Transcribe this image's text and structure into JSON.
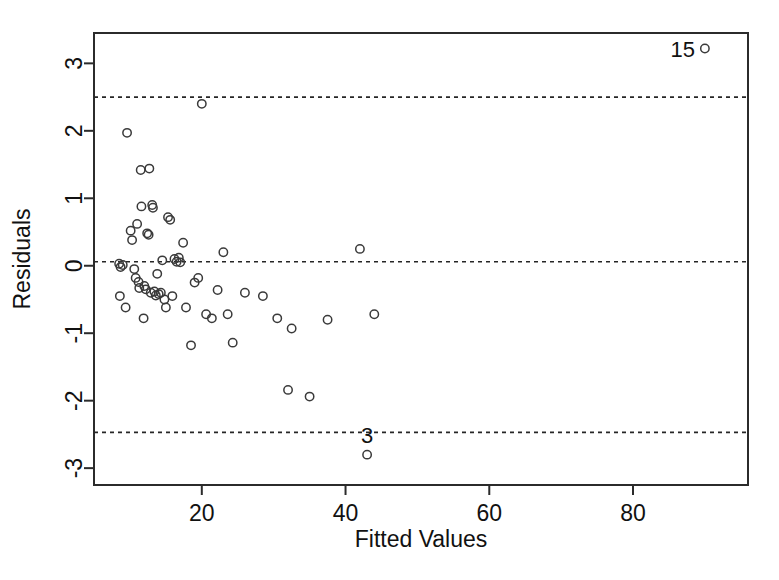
{
  "chart_data": {
    "type": "scatter",
    "title": "",
    "xlabel": "Fitted Values",
    "ylabel": "Residuals",
    "xlim": [
      5,
      96
    ],
    "ylim": [
      -3.25,
      3.45
    ],
    "xticks": [
      20,
      40,
      60,
      80
    ],
    "yticks": [
      3,
      2,
      1,
      0,
      -1,
      -2,
      -3
    ],
    "xtick_labels": [
      "20",
      "40",
      "60",
      "80"
    ],
    "ytick_labels": [
      "3",
      "2",
      "1",
      "0",
      "-1",
      "-2",
      "-3"
    ],
    "grid": false,
    "legend": "none",
    "marker": "open-circle",
    "reference_lines": [
      {
        "name": "upper-bound",
        "y": 2.5,
        "style": "dashed"
      },
      {
        "name": "zero-line",
        "y": 0.06,
        "style": "dashed"
      },
      {
        "name": "lower-bound",
        "y": -2.47,
        "style": "dashed"
      }
    ],
    "annotations": [
      {
        "text": "15",
        "x": 90.0,
        "y": 3.22,
        "position": "left-of-point"
      },
      {
        "text": "3",
        "x": 43.0,
        "y": -2.8,
        "position": "above-point"
      }
    ],
    "points": [
      {
        "x": 8.5,
        "y": 0.03
      },
      {
        "x": 8.7,
        "y": -0.02
      },
      {
        "x": 9.0,
        "y": 0.01
      },
      {
        "x": 8.6,
        "y": -0.45
      },
      {
        "x": 9.4,
        "y": -0.62
      },
      {
        "x": 9.6,
        "y": 1.97
      },
      {
        "x": 10.1,
        "y": 0.52
      },
      {
        "x": 10.3,
        "y": 0.38
      },
      {
        "x": 10.6,
        "y": -0.05
      },
      {
        "x": 10.8,
        "y": -0.18
      },
      {
        "x": 11.0,
        "y": 0.62
      },
      {
        "x": 11.2,
        "y": -0.24
      },
      {
        "x": 11.3,
        "y": -0.33
      },
      {
        "x": 11.5,
        "y": 1.42
      },
      {
        "x": 11.6,
        "y": 0.88
      },
      {
        "x": 11.9,
        "y": -0.78
      },
      {
        "x": 12.0,
        "y": -0.3
      },
      {
        "x": 12.2,
        "y": -0.35
      },
      {
        "x": 12.4,
        "y": 0.48
      },
      {
        "x": 12.6,
        "y": 0.46
      },
      {
        "x": 12.7,
        "y": 1.44
      },
      {
        "x": 12.9,
        "y": -0.4
      },
      {
        "x": 13.1,
        "y": 0.9
      },
      {
        "x": 13.2,
        "y": 0.86
      },
      {
        "x": 13.4,
        "y": -0.38
      },
      {
        "x": 13.6,
        "y": -0.44
      },
      {
        "x": 13.8,
        "y": -0.12
      },
      {
        "x": 14.0,
        "y": -0.42
      },
      {
        "x": 14.3,
        "y": -0.4
      },
      {
        "x": 14.5,
        "y": 0.08
      },
      {
        "x": 14.8,
        "y": -0.5
      },
      {
        "x": 15.0,
        "y": -0.62
      },
      {
        "x": 15.3,
        "y": 0.72
      },
      {
        "x": 15.6,
        "y": 0.68
      },
      {
        "x": 15.9,
        "y": -0.45
      },
      {
        "x": 16.2,
        "y": 0.1
      },
      {
        "x": 16.5,
        "y": 0.06
      },
      {
        "x": 16.8,
        "y": 0.12
      },
      {
        "x": 17.0,
        "y": 0.05
      },
      {
        "x": 17.4,
        "y": 0.34
      },
      {
        "x": 17.8,
        "y": -0.62
      },
      {
        "x": 18.5,
        "y": -1.18
      },
      {
        "x": 19.0,
        "y": -0.25
      },
      {
        "x": 19.5,
        "y": -0.18
      },
      {
        "x": 20.0,
        "y": 2.4
      },
      {
        "x": 20.6,
        "y": -0.72
      },
      {
        "x": 21.4,
        "y": -0.78
      },
      {
        "x": 22.2,
        "y": -0.36
      },
      {
        "x": 23.0,
        "y": 0.2
      },
      {
        "x": 23.6,
        "y": -0.72
      },
      {
        "x": 24.3,
        "y": -1.14
      },
      {
        "x": 26.0,
        "y": -0.4
      },
      {
        "x": 28.5,
        "y": -0.45
      },
      {
        "x": 30.5,
        "y": -0.78
      },
      {
        "x": 32.0,
        "y": -1.84
      },
      {
        "x": 32.5,
        "y": -0.93
      },
      {
        "x": 35.0,
        "y": -1.94
      },
      {
        "x": 37.5,
        "y": -0.8
      },
      {
        "x": 42.0,
        "y": 0.25
      },
      {
        "x": 43.0,
        "y": -2.8
      },
      {
        "x": 44.0,
        "y": -0.72
      },
      {
        "x": 90.0,
        "y": 3.22
      }
    ]
  }
}
